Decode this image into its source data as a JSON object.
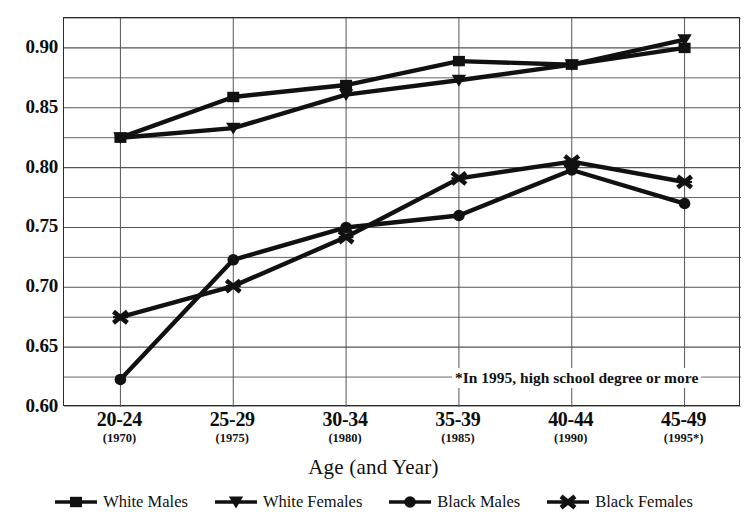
{
  "chart_data": {
    "type": "line",
    "title": "",
    "xlabel": "Age (and Year)",
    "ylabel": "",
    "categories": [
      "20-24",
      "25-29",
      "30-34",
      "35-39",
      "40-44",
      "45-49"
    ],
    "category_sublabels": [
      "(1970)",
      "(1975)",
      "(1980)",
      "(1985)",
      "(1990)",
      "(1995*)"
    ],
    "ylim": [
      0.6,
      0.925
    ],
    "ytick_values": [
      0.6,
      0.65,
      0.7,
      0.75,
      0.8,
      0.85,
      0.9
    ],
    "ytick_labels": [
      "0.60",
      "0.65",
      "0.70",
      "0.75",
      "0.80",
      "0.85",
      "0.90"
    ],
    "gridline_step": 0.025,
    "grid": true,
    "legend_position": "bottom",
    "annotation": "*In 1995, high school degree or more",
    "series": [
      {
        "name": "White Males",
        "marker": "square",
        "values": [
          0.825,
          0.859,
          0.869,
          0.889,
          0.886,
          0.9
        ]
      },
      {
        "name": "White Females",
        "marker": "triangle-down",
        "values": [
          0.825,
          0.833,
          0.861,
          0.873,
          0.886,
          0.907
        ]
      },
      {
        "name": "Black Males",
        "marker": "circle",
        "values": [
          0.623,
          0.723,
          0.75,
          0.76,
          0.798,
          0.77
        ]
      },
      {
        "name": "Black Females",
        "marker": "x-star",
        "values": [
          0.675,
          0.701,
          0.742,
          0.791,
          0.805,
          0.788
        ]
      }
    ]
  },
  "axis": {
    "x_title": "Age (and Year)"
  },
  "note": {
    "text": "*In 1995, high school degree or more"
  },
  "legend": {
    "items": [
      {
        "label": "White Males"
      },
      {
        "label": "White Females"
      },
      {
        "label": "Black Males"
      },
      {
        "label": "Black Females"
      }
    ]
  },
  "colors": {
    "ink": "#111111",
    "grid": "#555555",
    "frame": "#2b2b2b",
    "background": "#ffffff"
  }
}
